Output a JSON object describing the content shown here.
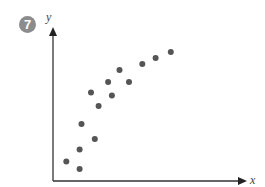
{
  "figure": {
    "number_badge": "7"
  },
  "chart_data": {
    "type": "scatter",
    "title": "",
    "xlabel": "x",
    "ylabel": "y",
    "grid": false,
    "legend": null,
    "axis_ticks": false,
    "note": "Unscaled axes; coordinates are relative (0-100) positions within the plot area, origin at bottom-left.",
    "xlim": [
      0,
      100
    ],
    "ylim": [
      0,
      100
    ],
    "points": [
      {
        "x": 7,
        "y": 13
      },
      {
        "x": 14,
        "y": 8
      },
      {
        "x": 14,
        "y": 21
      },
      {
        "x": 22,
        "y": 28
      },
      {
        "x": 15,
        "y": 38
      },
      {
        "x": 24,
        "y": 50
      },
      {
        "x": 20,
        "y": 59
      },
      {
        "x": 31,
        "y": 57
      },
      {
        "x": 29,
        "y": 66
      },
      {
        "x": 40,
        "y": 66
      },
      {
        "x": 35,
        "y": 74
      },
      {
        "x": 47,
        "y": 78
      },
      {
        "x": 54,
        "y": 82
      },
      {
        "x": 62,
        "y": 86
      }
    ],
    "color": "#555555",
    "axis_color": "#333333"
  }
}
